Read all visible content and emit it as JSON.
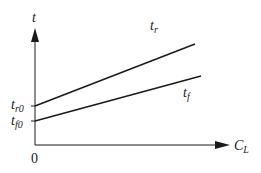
{
  "diagram": {
    "y_axis": {
      "label": "t"
    },
    "x_axis": {
      "label": "C",
      "label_sub": "L"
    },
    "origin_label": "0",
    "lines": [
      {
        "name": "t",
        "sub": "r",
        "intercept_label": "t",
        "intercept_sub": "r0"
      },
      {
        "name": "t",
        "sub": "f",
        "intercept_label": "t",
        "intercept_sub": "f0"
      }
    ],
    "colors": {
      "ink": "#1a1a1a",
      "background": "#ffffff"
    }
  }
}
